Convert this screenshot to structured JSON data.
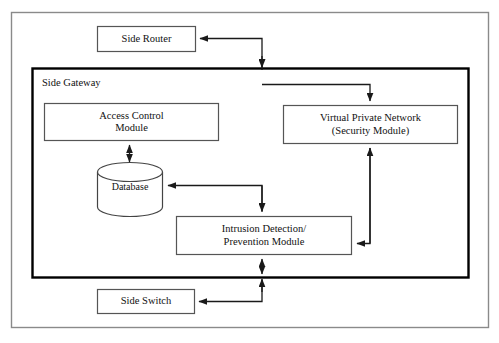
{
  "diagram": {
    "type": "block-diagram",
    "background_color": "#ffffff",
    "line_color": "#1a1a1a",
    "outer_frame": {
      "name": "figure-border"
    },
    "container": {
      "label": "Side Gateway",
      "border_color": "#000000"
    },
    "nodes": [
      {
        "id": "side-router",
        "label": "Side Router",
        "shape": "rectangle"
      },
      {
        "id": "access-control-module",
        "label": "Access Control\nModule",
        "shape": "rectangle"
      },
      {
        "id": "database",
        "label": "Database",
        "shape": "cylinder"
      },
      {
        "id": "virtual-private-network",
        "label": "Virtual Private Network\n(Security Module)",
        "shape": "rectangle"
      },
      {
        "id": "intrusion-detection-prevention-module",
        "label": "Intrusion Detection/\nPrevention Module",
        "shape": "rectangle"
      },
      {
        "id": "side-switch",
        "label": "Side Switch",
        "shape": "rectangle"
      }
    ],
    "edges": [
      {
        "from": "side-gateway",
        "to": "side-router",
        "arrow": "single"
      },
      {
        "from": "side-gateway",
        "to": "virtual-private-network",
        "arrow": "single"
      },
      {
        "from": "access-control-module",
        "to": "database",
        "arrow": "double"
      },
      {
        "from": "intrusion-detection-prevention-module",
        "to": "database",
        "arrow": "single"
      },
      {
        "from": "virtual-private-network",
        "to": "intrusion-detection-prevention-module",
        "arrow": "single"
      },
      {
        "from": "intrusion-detection-prevention-module",
        "to": "side-gateway-boundary",
        "arrow": "double"
      },
      {
        "from": "side-gateway",
        "to": "side-switch",
        "arrow": "single"
      }
    ]
  }
}
